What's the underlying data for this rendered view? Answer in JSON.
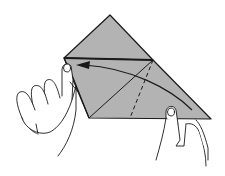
{
  "figure": {
    "description": "Origami folding step: hands holding a gray folded paper; arrow indicates folding the right tip over to the left corner",
    "paper_color": "#b3b3b3",
    "line_color": "#1a1a1a",
    "background": "#ffffff",
    "elements": {
      "paper": "folded-paper",
      "crease_solid": "diagonal crease line",
      "crease_dashed": "valley fold dashed line",
      "arrow": "fold direction arrow (right to left)",
      "left_hand": "left hand pinching left corner",
      "right_hand": "right hand holding bottom right edge"
    }
  }
}
